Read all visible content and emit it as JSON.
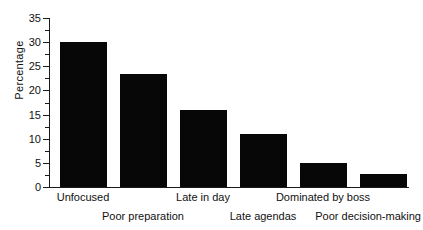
{
  "chart_data": {
    "type": "bar",
    "title": "",
    "subtitle": "",
    "xlabel": "",
    "ylabel": "Percentage",
    "categories": [
      "Unfocused",
      "Poor preparation",
      "Late in day",
      "Late agendas",
      "Dominated by boss",
      "Poor decision-making"
    ],
    "values": [
      30,
      23.5,
      16,
      11,
      5,
      2.7
    ],
    "ylim": [
      0,
      35
    ],
    "ytick_labels": [
      "0",
      "5",
      "10",
      "15",
      "20",
      "25",
      "30",
      "35"
    ],
    "ytick_values": [
      0,
      5,
      10,
      15,
      20,
      25,
      30,
      35
    ],
    "yminor_values": [
      2.5,
      7.5,
      12.5,
      17.5,
      22.5,
      27.5,
      32.5
    ],
    "grid": false,
    "legend": false,
    "legend_position": "none",
    "bar_color": "#070707",
    "axis_color": "#1a1a1a",
    "background_color": "#ffffff",
    "annotations": [],
    "label_rows": [
      0,
      1,
      0,
      1,
      0,
      1
    ]
  }
}
